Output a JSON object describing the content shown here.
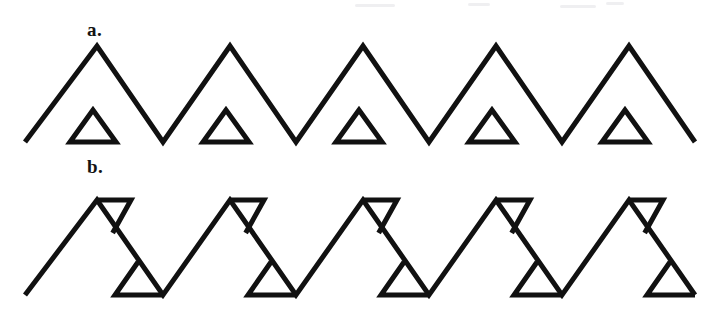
{
  "figure": {
    "title": "",
    "background_color": "#ffffff",
    "stroke_color": "#111111",
    "stroke_width": 5,
    "width": 709,
    "height": 309,
    "panels": [
      {
        "id": "a",
        "label": "a.",
        "label_x": 87,
        "label_y": 20,
        "description": "Zigzag line with five upward peaks; a separate small upward-pointing triangle outline sits in each valley region beneath the zigzag.",
        "zigzag": {
          "type": "polyline",
          "baseline_y": 142,
          "peak_y": 46,
          "peak_count": 5,
          "period": 133,
          "first_peak_x": 97,
          "start_point": [
            25,
            142
          ],
          "end_point": [
            683,
            142
          ],
          "points": "25,142 97,46 163,142 230,46 296,142 363,46 429,142 496,46 562,142 629,46 695,142"
        },
        "small_triangles": {
          "count": 5,
          "orientation": "up",
          "width": 46,
          "height": 32,
          "base_y": 142,
          "apex_y": 110,
          "centers_x": [
            93,
            226,
            359,
            492,
            625
          ],
          "points_template": "cx,110 cx-23,142 cx+23,142"
        }
      },
      {
        "id": "b",
        "label": "b.",
        "label_x": 87,
        "label_y": 157,
        "description": "Zigzag line of five steeply descending strokes; each peak carries a horizontal bar to the right forming a downward-pointing triangle, and each trough carries a horizontal bar forming an upward-pointing triangle.",
        "zigzag": {
          "type": "polyline",
          "baseline_y": 295,
          "peak_y": 200,
          "peak_count": 5,
          "period": 133,
          "first_peak_x": 97,
          "start_point": [
            25,
            295
          ],
          "end_point": [
            690,
            295
          ]
        },
        "peak_triangles": {
          "count": 5,
          "orientation": "down",
          "bar_length": 34,
          "apex_drop": 33,
          "peaks_x": [
            97,
            230,
            363,
            496,
            629
          ],
          "top_y": 200
        },
        "trough_triangles": {
          "count": 5,
          "orientation": "up",
          "bar_length": 48,
          "apex_rise": 33,
          "troughs_x": [
            163,
            296,
            429,
            562,
            695
          ],
          "base_y": 295
        }
      }
    ]
  }
}
